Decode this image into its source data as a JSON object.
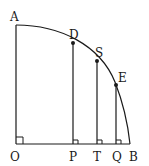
{
  "diagram": {
    "labels": {
      "A": "A",
      "D": "D",
      "S": "S",
      "E": "E",
      "O": "O",
      "P": "P",
      "T": "T",
      "Q": "Q",
      "B": "B"
    },
    "stroke_color": "#1a1a1a"
  }
}
